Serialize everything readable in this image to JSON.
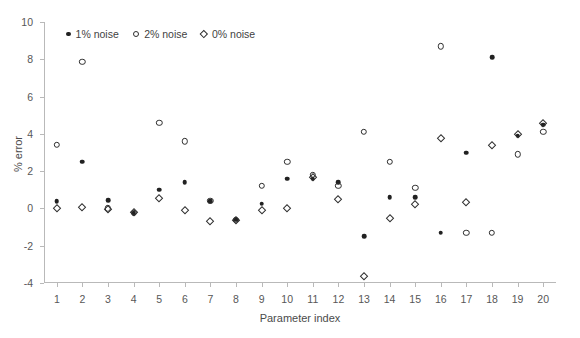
{
  "chart_data": {
    "type": "scatter",
    "title": "",
    "xlabel": "Parameter index",
    "ylabel": "% error",
    "xlim": [
      0.5,
      20.5
    ],
    "ylim": [
      -4,
      10
    ],
    "yticks": [
      -4,
      -2,
      0,
      2,
      4,
      6,
      8,
      10
    ],
    "xticks": [
      1,
      2,
      3,
      4,
      5,
      6,
      7,
      8,
      9,
      10,
      11,
      12,
      13,
      14,
      15,
      16,
      17,
      18,
      19,
      20
    ],
    "grid": false,
    "legend_position": "top-left-inside",
    "x": [
      1,
      2,
      3,
      4,
      5,
      6,
      7,
      8,
      9,
      10,
      11,
      12,
      13,
      14,
      15,
      16,
      17,
      18,
      19,
      20
    ],
    "series": [
      {
        "name": "1% noise",
        "marker": "filled-circle",
        "color": "#212121",
        "values": [
          0.4,
          2.5,
          0.45,
          -0.25,
          1.0,
          1.4,
          0.4,
          -0.6,
          0.25,
          1.6,
          1.6,
          1.4,
          -1.5,
          0.6,
          0.6,
          -1.3,
          3.0,
          8.1,
          3.9,
          4.5
        ]
      },
      {
        "name": "2% noise",
        "marker": "open-circle",
        "color": "#2e2e2e",
        "values": [
          3.4,
          7.85,
          0.0,
          -0.25,
          4.6,
          3.6,
          0.4,
          -0.6,
          1.2,
          2.5,
          1.8,
          1.2,
          4.1,
          2.5,
          1.1,
          8.7,
          -1.3,
          -1.3,
          2.9,
          4.1
        ]
      },
      {
        "name": "0% noise",
        "marker": "open-diamond",
        "color": "#2e2e2e",
        "values": [
          0.0,
          0.05,
          -0.05,
          -0.2,
          0.55,
          -0.1,
          -0.7,
          -0.6,
          -0.1,
          0.0,
          1.7,
          0.5,
          -3.6,
          -0.5,
          0.25,
          3.8,
          0.35,
          3.4,
          4.0,
          4.6
        ]
      }
    ]
  },
  "legend": {
    "entries": [
      {
        "label": "1% noise",
        "marker": "filled-circle"
      },
      {
        "label": "2% noise",
        "marker": "open-circle"
      },
      {
        "label": "0% noise",
        "marker": "open-diamond"
      }
    ]
  }
}
